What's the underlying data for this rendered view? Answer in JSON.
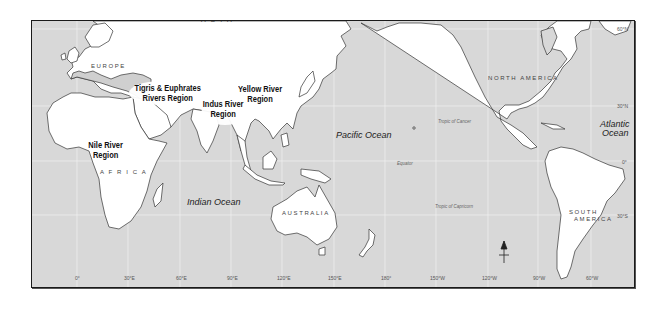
{
  "map": {
    "regions": [
      {
        "id": "nile",
        "line1": "Nile River",
        "line2": "Region"
      },
      {
        "id": "tigris",
        "line1": "Tigris & Euphrates",
        "line2": "Rivers Region"
      },
      {
        "id": "indus",
        "line1": "Indus River",
        "line2": "Region"
      },
      {
        "id": "yellow",
        "line1": "Yellow River",
        "line2": "Region"
      }
    ],
    "continents": {
      "asia": "A S I A",
      "europe": "EUROPE",
      "africa": "A F R I C A",
      "australia": "AUSTRALIA",
      "north_america": "NORTH AMERICA",
      "south_america_1": "SOUTH",
      "south_america_2": "AMERICA"
    },
    "oceans": {
      "pacific": "Pacific Ocean",
      "indian": "Indian Ocean",
      "atlantic_1": "Atlantic",
      "atlantic_2": "Ocean"
    },
    "reference_lines": {
      "tropic_cancer": "Tropic of Cancer",
      "equator": "Equator",
      "tropic_capricorn": "Tropic of Capricorn"
    },
    "latitudes": [
      "60°N",
      "30°N",
      "0°",
      "30°S"
    ],
    "longitudes": [
      "0°",
      "30°E",
      "60°E",
      "90°E",
      "120°E",
      "150°E",
      "180°",
      "150°W",
      "120°W",
      "90°W",
      "60°W"
    ],
    "colors": {
      "ocean": "#d8d8d8",
      "land": "#ffffff",
      "land_shaded": "#c8c8c8",
      "coast": "#333333",
      "grid": "#f2f2f2"
    }
  }
}
